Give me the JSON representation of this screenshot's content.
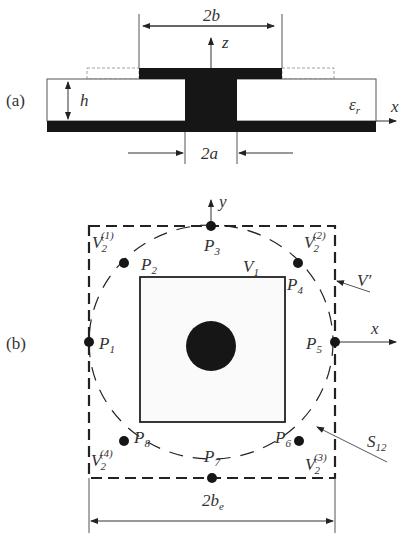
{
  "figure": {
    "panel_a": {
      "label": "(a)",
      "dim_top": "2b",
      "dim_bottom": "2a",
      "height_label": "h",
      "axis_z": "z",
      "axis_x": "x",
      "permittivity_base": "ε",
      "permittivity_sub": "r"
    },
    "panel_b": {
      "label": "(b)",
      "axis_y": "y",
      "axis_x": "x",
      "points": [
        {
          "base": "P",
          "sub": "1"
        },
        {
          "base": "P",
          "sub": "2"
        },
        {
          "base": "P",
          "sub": "3"
        },
        {
          "base": "P",
          "sub": "4"
        },
        {
          "base": "P",
          "sub": "5"
        },
        {
          "base": "P",
          "sub": "6"
        },
        {
          "base": "P",
          "sub": "7"
        },
        {
          "base": "P",
          "sub": "8"
        }
      ],
      "regions": {
        "v1": {
          "base": "V",
          "sub": "1"
        },
        "v2_1": {
          "base": "V",
          "sub": "2",
          "sup": "(1)"
        },
        "v2_2": {
          "base": "V",
          "sub": "2",
          "sup": "(2)"
        },
        "v2_3": {
          "base": "V",
          "sub": "2",
          "sup": "(3)"
        },
        "v2_4": {
          "base": "V",
          "sub": "2",
          "sup": "(4)"
        },
        "vprime": "V′",
        "s12": {
          "base": "S",
          "sub": "12"
        }
      },
      "dim_bottom": {
        "base": "2b",
        "sub": "e"
      }
    }
  }
}
